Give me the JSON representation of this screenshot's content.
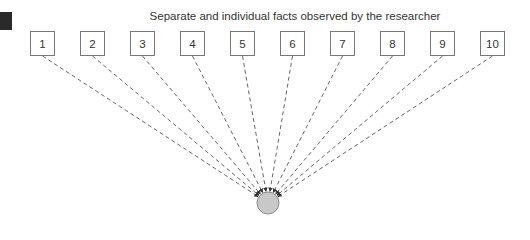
{
  "diagram": {
    "title": "Separate and individual facts observed by the researcher",
    "facts": [
      "1",
      "2",
      "3",
      "4",
      "5",
      "6",
      "7",
      "8",
      "9",
      "10"
    ],
    "target": {
      "label": "",
      "fill": "#c8c8c8",
      "stroke": "#888888"
    },
    "line_color": "#555555",
    "line_style": "dashed"
  }
}
